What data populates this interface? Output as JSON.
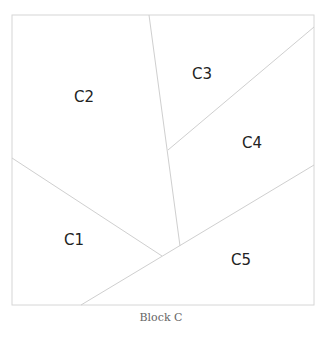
{
  "diagram": {
    "caption": "Block C",
    "line_color": "#cfcfcf",
    "border_color": "#d6d6d6",
    "label_color": "#222222",
    "regions": [
      {
        "id": "C1",
        "label": "C1",
        "x": 64,
        "y": 238
      },
      {
        "id": "C2",
        "label": "C2",
        "x": 84,
        "y": 95
      },
      {
        "id": "C3",
        "label": "C3",
        "x": 202,
        "y": 72
      },
      {
        "id": "C4",
        "label": "C4",
        "x": 253,
        "y": 142
      },
      {
        "id": "C5",
        "label": "C5",
        "x": 241,
        "y": 259
      }
    ]
  }
}
